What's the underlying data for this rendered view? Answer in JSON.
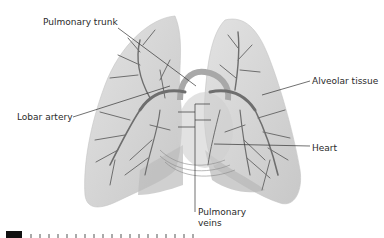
{
  "figure": {
    "labels": {
      "pulmonary_trunk": "Pulmonary trunk",
      "lobar_artery": "Lobar artery",
      "alveolar_tissue": "Alveolar tissue",
      "heart": "Heart",
      "pulmonary_veins_line1": "Pulmonary",
      "pulmonary_veins_line2": "veins"
    },
    "colors": {
      "lung_fill": "#d6d6d6",
      "lung_shade": "#bdbdbd",
      "vessel": "#6e6e6e",
      "leader_line": "#333333",
      "text": "#2a2a2a"
    }
  }
}
